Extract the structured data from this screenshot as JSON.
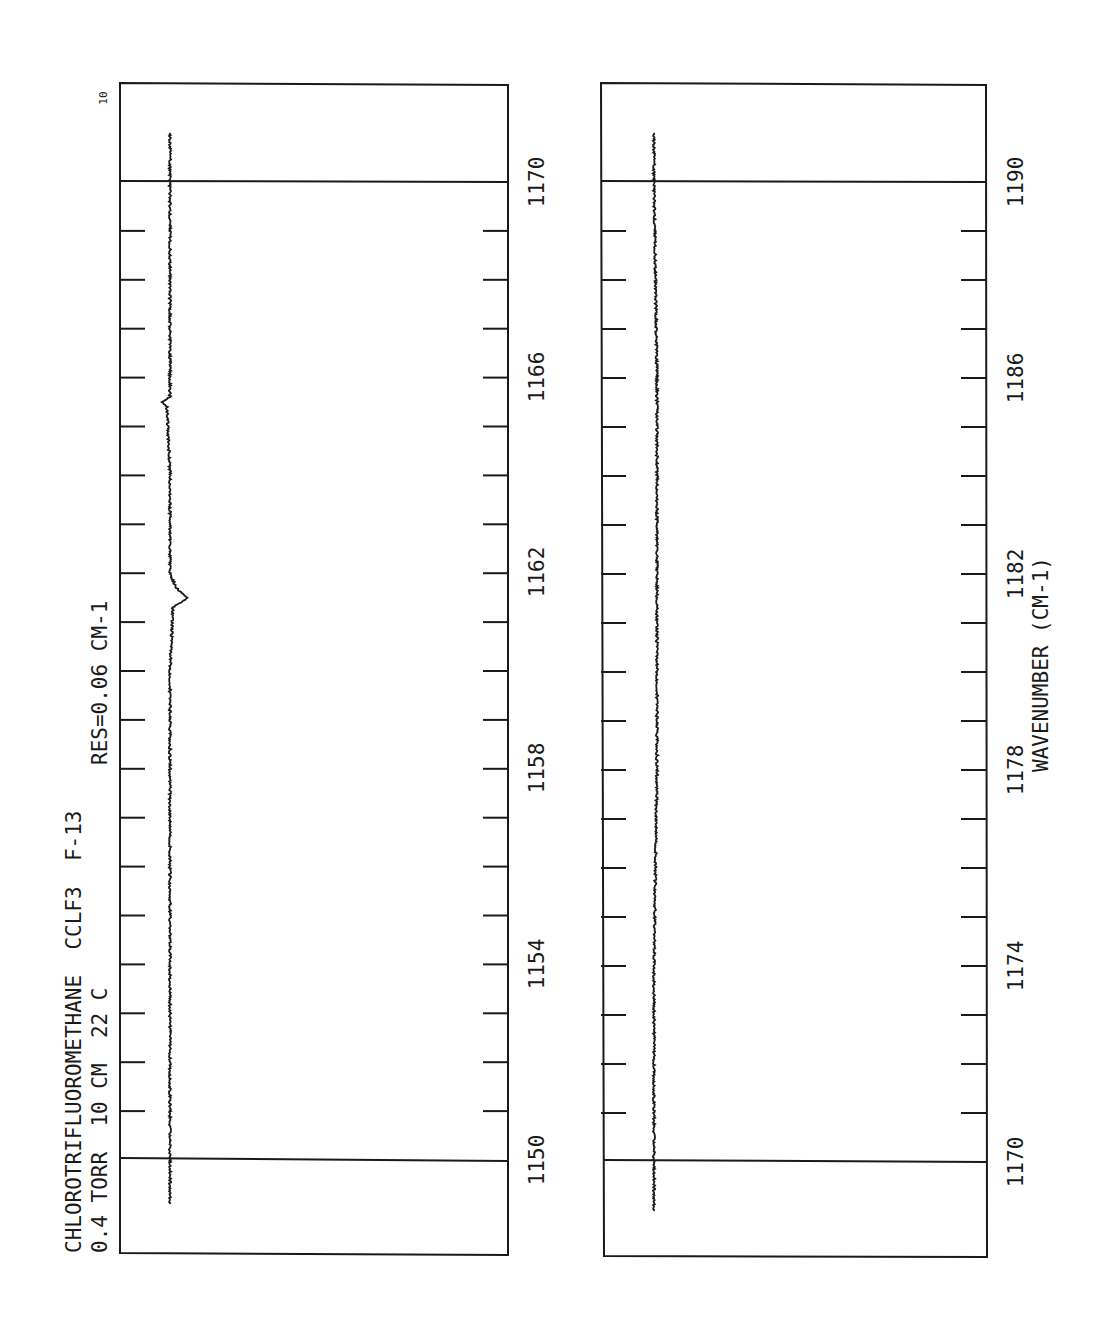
{
  "header": {
    "line1": "CHLOROTRIFLUOROMETHANE  CCLF3  F-13",
    "line2": "0.4 TORR  10 CM  22 C",
    "resolution": "RES=0.06 CM-1",
    "scale_marker": "10"
  },
  "x_axis": {
    "label": "WAVENUMBER (CM-1)"
  },
  "panels": [
    {
      "id": "left",
      "tick_labels": [
        "1150",
        "1154",
        "1158",
        "1162",
        "1166",
        "1170"
      ]
    },
    {
      "id": "right",
      "tick_labels": [
        "1170",
        "1174",
        "1178",
        "1182",
        "1186",
        "1190"
      ]
    }
  ],
  "chart_data": [
    {
      "type": "line",
      "title": "CHLOROTRIFLUOROMETHANE CCLF3 F-13",
      "subtitle": "0.4 TORR 10 CM 22 C  RES=0.06 CM-1",
      "xlabel": "WAVENUMBER (CM-1)",
      "ylabel": "Transmittance",
      "orientation": "rotated 90 degrees (wavenumber runs vertically, increasing upward)",
      "xlim": [
        1149.1,
        1171.0
      ],
      "x_major_ticks": [
        1150,
        1154,
        1158,
        1162,
        1166,
        1170
      ],
      "x_minor_ticks": [
        1151,
        1152,
        1153,
        1155,
        1156,
        1157,
        1159,
        1160,
        1161,
        1163,
        1164,
        1165,
        1167,
        1168,
        1169
      ],
      "reference_lines": [
        1150,
        1170
      ],
      "series": [
        {
          "name": "spectrum 1150-1170",
          "x": [
            1149.1,
            1150,
            1152,
            1154,
            1156,
            1158,
            1160,
            1161.3,
            1161.5,
            1161.7,
            1162,
            1164,
            1165.4,
            1165.5,
            1165.6,
            1166,
            1168,
            1170,
            1171
          ],
          "values": [
            0.15,
            0.15,
            0.15,
            0.15,
            0.15,
            0.15,
            0.15,
            0.16,
            0.21,
            0.17,
            0.15,
            0.15,
            0.14,
            0.12,
            0.15,
            0.15,
            0.15,
            0.15,
            0.15
          ]
        }
      ],
      "annotations": [
        "10 (scale marker at top-left)"
      ]
    },
    {
      "type": "line",
      "xlabel": "WAVENUMBER (CM-1)",
      "orientation": "rotated 90 degrees (wavenumber runs vertically, increasing upward)",
      "xlim": [
        1169.0,
        1191.0
      ],
      "x_major_ticks": [
        1170,
        1174,
        1178,
        1182,
        1186,
        1190
      ],
      "x_minor_ticks": [
        1171,
        1172,
        1173,
        1175,
        1176,
        1177,
        1179,
        1180,
        1181,
        1183,
        1184,
        1185,
        1187,
        1188,
        1189
      ],
      "reference_lines": [
        1170,
        1190
      ],
      "series": [
        {
          "name": "spectrum 1170-1190",
          "x": [
            1169,
            1170,
            1174,
            1178,
            1182,
            1186,
            1190,
            1191
          ],
          "values": [
            0.14,
            0.14,
            0.14,
            0.15,
            0.15,
            0.15,
            0.14,
            0.14
          ]
        }
      ]
    }
  ]
}
